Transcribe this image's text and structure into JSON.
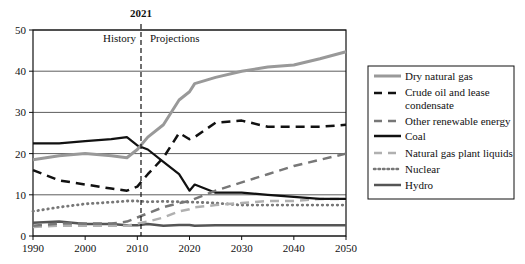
{
  "chart_data": {
    "type": "line",
    "title": "",
    "marker_annotation": {
      "year": 2021,
      "label": "2021",
      "left_label": "History",
      "right_label": "Projections"
    },
    "xlabel": "",
    "ylabel": "",
    "xlim": [
      1990,
      2050
    ],
    "ylim": [
      0,
      50
    ],
    "x_ticks": [
      "1990",
      "2000",
      "2010",
      "2020",
      "2030",
      "2040",
      "2050"
    ],
    "y_ticks": [
      "0",
      "10",
      "20",
      "30",
      "40",
      "50"
    ],
    "grid": "horizontal",
    "legend_position": "right",
    "x": [
      1990,
      1995,
      2000,
      2005,
      2008,
      2010,
      2012,
      2015,
      2018,
      2020,
      2021,
      2025,
      2030,
      2035,
      2040,
      2045,
      2050
    ],
    "series": [
      {
        "name": "Dry natural gas",
        "style": "solid-gray",
        "color": "#999999",
        "values": [
          18.5,
          19.5,
          20,
          19.5,
          19,
          21,
          24,
          27,
          33,
          35,
          37,
          38.5,
          40,
          41,
          41.5,
          43,
          44.7
        ]
      },
      {
        "name": "Crude oil and lease condensate",
        "style": "dashed-black",
        "color": "#111111",
        "values": [
          16,
          13.5,
          12.5,
          11.5,
          11,
          12,
          15,
          19,
          25,
          23.5,
          24,
          27.5,
          28,
          26.5,
          26.5,
          26.5,
          27
        ]
      },
      {
        "name": "Other renewable energy",
        "style": "dashed-gray",
        "color": "#777777",
        "values": [
          2.5,
          3,
          3,
          3,
          3.5,
          4.5,
          5.5,
          7,
          8,
          8.5,
          9,
          11,
          13,
          15,
          17,
          18.5,
          20
        ]
      },
      {
        "name": "Coal",
        "style": "solid-black",
        "color": "#111111",
        "values": [
          22.5,
          22.5,
          23,
          23.5,
          24,
          22,
          21,
          18,
          15,
          11,
          12.5,
          10.5,
          10.5,
          10,
          9.5,
          9,
          9
        ]
      },
      {
        "name": "Natural gas plant liquids",
        "style": "dashed-lightgray",
        "color": "#b0b0b0",
        "values": [
          2.2,
          2.5,
          2.5,
          2.5,
          2.5,
          3,
          3.5,
          4.5,
          6,
          6.5,
          7,
          7.5,
          8,
          8.5,
          8.5,
          9,
          9
        ]
      },
      {
        "name": "Nuclear",
        "style": "dotted-gray",
        "color": "#777777",
        "values": [
          6,
          7,
          7.8,
          8.2,
          8.5,
          8.5,
          8.3,
          8.4,
          8.3,
          8.2,
          8.2,
          8,
          7.5,
          7.5,
          7.5,
          7.5,
          7.5
        ]
      },
      {
        "name": "Hydro",
        "style": "solid-darkgray",
        "color": "#555555",
        "values": [
          3.2,
          3.5,
          2.9,
          2.9,
          2.6,
          2.6,
          2.9,
          2.5,
          2.7,
          2.7,
          2.5,
          2.6,
          2.6,
          2.6,
          2.6,
          2.6,
          2.6
        ]
      }
    ]
  },
  "legend": {
    "items": [
      {
        "label": "Dry natural gas"
      },
      {
        "label_line1": "Crude oil and lease",
        "label_line2": "condensate"
      },
      {
        "label": "Other renewable energy"
      },
      {
        "label": "Coal"
      },
      {
        "label": "Natural gas plant liquids"
      },
      {
        "label": "Nuclear"
      },
      {
        "label": "Hydro"
      }
    ]
  }
}
